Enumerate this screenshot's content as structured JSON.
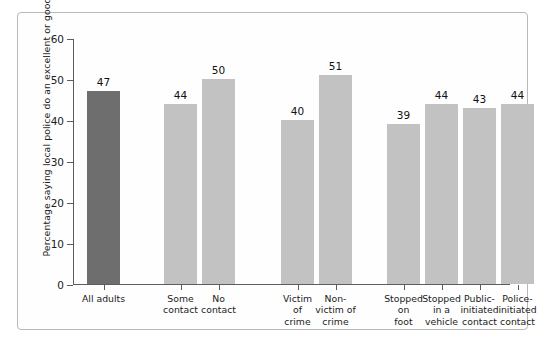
{
  "chart_data": {
    "type": "bar",
    "title": "",
    "subtitle": "",
    "xlabel": "",
    "ylabel": "Percentage saying local police do an excellent or good job",
    "ylim": [
      0,
      60
    ],
    "yticks": [
      0,
      10,
      20,
      30,
      40,
      50,
      60
    ],
    "ytick_labels": [
      "0",
      "10",
      "20",
      "30",
      "40",
      "50",
      "60"
    ],
    "grid": false,
    "legend": "none",
    "categories": [
      "All adults",
      "Some contact",
      "No contact",
      "Victim of crime",
      "Non-victim of crime",
      "Stopped on foot",
      "Stopped in a vehicle",
      "Public-initiated contact",
      "Police-initiated contact"
    ],
    "values": [
      47,
      44,
      50,
      40,
      51,
      39,
      44,
      43,
      44
    ],
    "bar_colors": [
      "#6e6e6e",
      "#c2c2c2",
      "#c2c2c2",
      "#c2c2c2",
      "#c2c2c2",
      "#c2c2c2",
      "#c2c2c2",
      "#c2c2c2",
      "#c2c2c2"
    ],
    "groups": [
      {
        "label": "",
        "members": [
          "All adults"
        ]
      },
      {
        "label": "",
        "members": [
          "Some contact",
          "No contact"
        ]
      },
      {
        "label": "",
        "members": [
          "Victim of crime",
          "Non-victim of crime"
        ]
      },
      {
        "label": "",
        "members": [
          "Stopped on foot",
          "Stopped in a vehicle",
          "Public-initiated contact",
          "Police-initiated contact"
        ]
      }
    ]
  },
  "axis": {
    "y_title": "Percentage saying local police do an excellent or good job",
    "ticks": [
      {
        "value": "60"
      },
      {
        "value": "50"
      },
      {
        "value": "40"
      },
      {
        "value": "30"
      },
      {
        "value": "20"
      },
      {
        "value": "10"
      },
      {
        "value": "0"
      }
    ]
  },
  "bars": [
    {
      "value": "47",
      "label_lines": [
        "All adults"
      ]
    },
    {
      "value": "44",
      "label_lines": [
        "Some",
        "contact"
      ]
    },
    {
      "value": "50",
      "label_lines": [
        "No",
        "contact"
      ]
    },
    {
      "value": "40",
      "label_lines": [
        "Victim",
        "of",
        "crime"
      ]
    },
    {
      "value": "51",
      "label_lines": [
        "Non-",
        "victim of",
        "crime"
      ]
    },
    {
      "value": "39",
      "label_lines": [
        "Stopped",
        "on",
        "foot"
      ]
    },
    {
      "value": "44",
      "label_lines": [
        "Stopped",
        "in a",
        "vehicle"
      ]
    },
    {
      "value": "43",
      "label_lines": [
        "Public-",
        "initiated",
        "contact"
      ]
    },
    {
      "value": "44",
      "label_lines": [
        "Police-",
        "initiated",
        "contact"
      ]
    }
  ],
  "colors": {
    "bar_highlight": "#6e6e6e",
    "bar_default": "#c2c2c2",
    "axis": "#5c5c5c",
    "text": "#1b1b1b",
    "frame": "#b9b9b9",
    "background": "#ffffff"
  }
}
